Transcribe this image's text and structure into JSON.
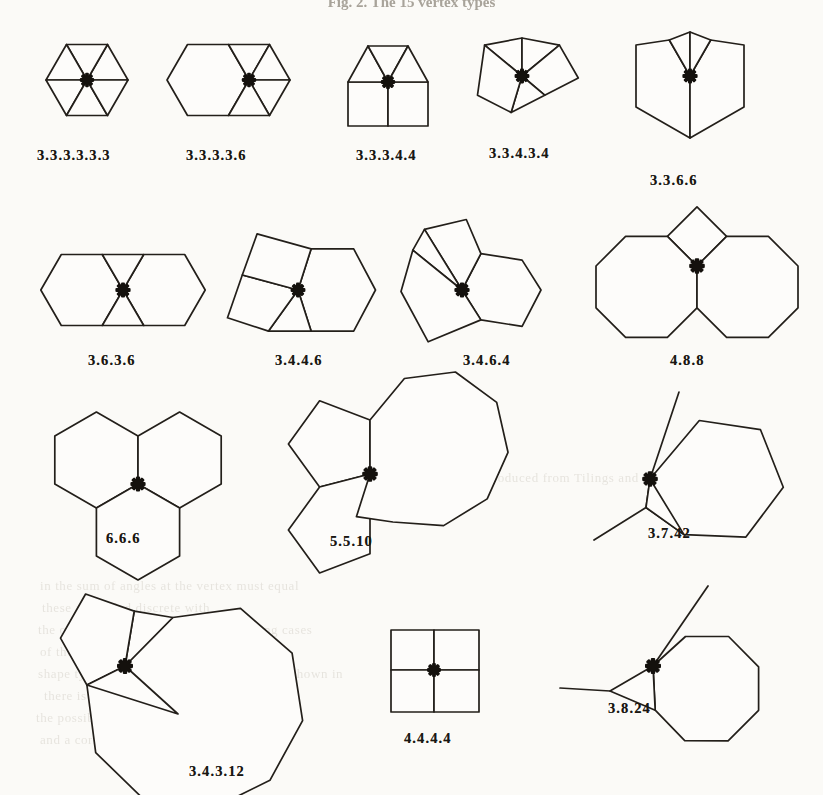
{
  "figure": {
    "title": "Fig. 2. The 15 vertex types",
    "star_marker_name": "vertex-star-marker",
    "line_color": "#231f1a",
    "page_background": "#fbfaf7",
    "count": 15
  },
  "vertex_types": [
    {
      "id": "v1",
      "label": "3.3.3.3.3.3",
      "polygons": [
        3,
        3,
        3,
        3,
        3,
        3
      ],
      "row": 1,
      "col": 1
    },
    {
      "id": "v2",
      "label": "3.3.3.3.6",
      "polygons": [
        3,
        3,
        3,
        3,
        6
      ],
      "row": 1,
      "col": 2
    },
    {
      "id": "v3",
      "label": "3.3.3.4.4",
      "polygons": [
        3,
        3,
        3,
        4,
        4
      ],
      "row": 1,
      "col": 3
    },
    {
      "id": "v4",
      "label": "3.3.4.3.4",
      "polygons": [
        3,
        3,
        4,
        3,
        4
      ],
      "row": 1,
      "col": 4
    },
    {
      "id": "v5",
      "label": "3.3.6.6",
      "polygons": [
        3,
        3,
        6,
        6
      ],
      "row": 1,
      "col": 5
    },
    {
      "id": "v6",
      "label": "3.6.3.6",
      "polygons": [
        3,
        6,
        3,
        6
      ],
      "row": 2,
      "col": 1
    },
    {
      "id": "v7",
      "label": "3.4.4.6",
      "polygons": [
        3,
        4,
        4,
        6
      ],
      "row": 2,
      "col": 2
    },
    {
      "id": "v8",
      "label": "3.4.6.4",
      "polygons": [
        3,
        4,
        6,
        4
      ],
      "row": 2,
      "col": 3
    },
    {
      "id": "v9",
      "label": "4.8.8",
      "polygons": [
        4,
        8,
        8
      ],
      "row": 2,
      "col": 4
    },
    {
      "id": "v10",
      "label": "6.6.6",
      "polygons": [
        6,
        6,
        6
      ],
      "row": 3,
      "col": 1
    },
    {
      "id": "v11",
      "label": "5.5.10",
      "polygons": [
        5,
        5,
        10
      ],
      "row": 3,
      "col": 2
    },
    {
      "id": "v12",
      "label": "3.7.42",
      "polygons": [
        3,
        7,
        42
      ],
      "row": 3,
      "col": 3
    },
    {
      "id": "v13",
      "label": "3.4.3.12",
      "polygons": [
        3,
        4,
        3,
        12
      ],
      "row": 4,
      "col": 1
    },
    {
      "id": "v14",
      "label": "4.4.4.4",
      "polygons": [
        4,
        4,
        4,
        4
      ],
      "row": 4,
      "col": 2
    },
    {
      "id": "v15",
      "label": "3.8.24",
      "polygons": [
        3,
        8,
        24
      ],
      "row": 4,
      "col": 3
    }
  ],
  "background_text": [
    {
      "text": "Reproduced from Tilings and Patterns",
      "x": 470,
      "y": 470
    },
    {
      "text": "in the sum of angles at the vertex must equal",
      "x": 40,
      "y": 578
    },
    {
      "text": "these are called discrete with",
      "x": 42,
      "y": 600
    },
    {
      "text": "the only possible ones, and the remaining cases",
      "x": 38,
      "y": 622
    },
    {
      "text": "of the angles in the polygons approach",
      "x": 40,
      "y": 644
    },
    {
      "text": "shape type of the vertex. Some of these are shown in",
      "x": 38,
      "y": 666
    },
    {
      "text": "there is no tiling with these vertices",
      "x": 44,
      "y": 688
    },
    {
      "text": "the possible vertex types of the tiling",
      "x": 36,
      "y": 710
    },
    {
      "text": "and a corresponding tiling exists for each",
      "x": 40,
      "y": 732
    }
  ]
}
